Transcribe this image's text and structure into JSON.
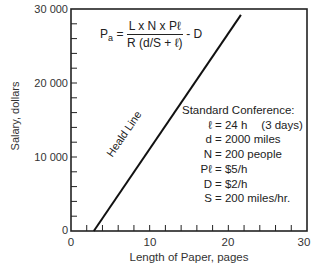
{
  "chart_data": {
    "type": "line",
    "title": "",
    "xlabel": "Length of Paper, pages",
    "ylabel": "Salary, dollars",
    "xlim": [
      0,
      30
    ],
    "ylim": [
      0,
      30000
    ],
    "x_ticks": [
      0,
      10,
      20,
      30
    ],
    "y_ticks": [
      0,
      10000,
      20000,
      30000
    ],
    "x_tick_labels": [
      "0",
      "10",
      "20",
      "30"
    ],
    "y_tick_labels": [
      "0",
      "10 000",
      "20 000",
      "30 000"
    ],
    "x_minor_step": 2,
    "y_minor_step": 2000,
    "grid": false,
    "series": [
      {
        "name": "Heald Line",
        "x": [
          2.9,
          21.6
        ],
        "y": [
          0,
          29200
        ]
      }
    ],
    "annotations": {
      "line_label": "Heald Line",
      "formula": {
        "lhs": "Pa",
        "numerator": "L x N x Pℓ",
        "denominator": "R (d/S + ℓ)",
        "tail": "- D"
      },
      "conditions_title": "Standard Conference:",
      "conditions": [
        {
          "key": "ℓ",
          "value": "= 24 h",
          "note": "(3 days)"
        },
        {
          "key": "d",
          "value": "= 2000 miles",
          "note": ""
        },
        {
          "key": "N",
          "value": "= 200 people",
          "note": ""
        },
        {
          "key": "Pℓ",
          "value": "= $5/h",
          "note": ""
        },
        {
          "key": "D",
          "value": "= $2/h",
          "note": ""
        },
        {
          "key": "S",
          "value": "= 200 miles/hr.",
          "note": ""
        }
      ]
    }
  }
}
